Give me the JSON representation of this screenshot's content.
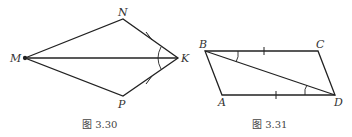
{
  "figures": [
    {
      "caption": "图 3.30",
      "points": {
        "M": "M",
        "N": "N",
        "K": "K",
        "P": "P"
      },
      "shape": "kite MNKP with diagonal MK; NK = PK marked with ticks; angle at K marked"
    },
    {
      "caption": "图 3.31",
      "points": {
        "A": "A",
        "B": "B",
        "C": "C",
        "D": "D"
      },
      "shape": "parallelogram ABCD with diagonal BD; BC = AD marked with ticks; angles CBD and ADB marked"
    }
  ],
  "colors": {
    "stroke": "#222222",
    "label": "#333333"
  }
}
